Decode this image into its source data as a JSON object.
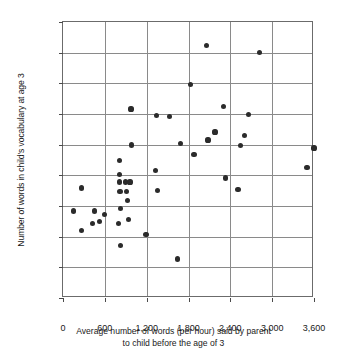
{
  "chart_data": {
    "type": "scatter",
    "title": "",
    "xlabel": "Average number of words (per hour) said by parent to child before the age of 3",
    "xlabel_line1": "Average number of words (per hour) said by parent",
    "xlabel_line2": "to child before the age of 3",
    "ylabel": "Number of words in child's vocabulary at age 3",
    "xlim": [
      0,
      3600
    ],
    "ylim": [
      0,
      1800
    ],
    "xticks": [
      0,
      600,
      1200,
      1800,
      2400,
      3000,
      3600
    ],
    "xtick_labels": [
      "0",
      "600",
      "1,200",
      "1,800",
      "2,400",
      "3,000",
      "3,600"
    ],
    "yticks": [
      0,
      200,
      400,
      600,
      800,
      1000,
      1200,
      1400,
      1600,
      1800
    ],
    "ytick_labels": [
      "0",
      "200",
      "400",
      "600",
      "800",
      "1,000",
      "1,200",
      "1,400",
      "1,600",
      "1,800"
    ],
    "grid": true,
    "legend": "none",
    "marker_color": "#2b2b2b",
    "axis_color": "#6b6b6b",
    "grid_color": "#8a8a8a",
    "points": [
      {
        "x": 150,
        "y": 568
      },
      {
        "x": 270,
        "y": 718
      },
      {
        "x": 265,
        "y": 440
      },
      {
        "x": 420,
        "y": 484
      },
      {
        "x": 455,
        "y": 568
      },
      {
        "x": 520,
        "y": 498
      },
      {
        "x": 600,
        "y": 546
      },
      {
        "x": 800,
        "y": 488
      },
      {
        "x": 805,
        "y": 898
      },
      {
        "x": 810,
        "y": 808
      },
      {
        "x": 815,
        "y": 756
      },
      {
        "x": 818,
        "y": 696
      },
      {
        "x": 820,
        "y": 586
      },
      {
        "x": 830,
        "y": 340
      },
      {
        "x": 900,
        "y": 756
      },
      {
        "x": 905,
        "y": 696
      },
      {
        "x": 930,
        "y": 636
      },
      {
        "x": 940,
        "y": 512
      },
      {
        "x": 960,
        "y": 756
      },
      {
        "x": 975,
        "y": 1232
      },
      {
        "x": 985,
        "y": 998
      },
      {
        "x": 1190,
        "y": 412
      },
      {
        "x": 1330,
        "y": 832
      },
      {
        "x": 1345,
        "y": 1192
      },
      {
        "x": 1360,
        "y": 702
      },
      {
        "x": 1530,
        "y": 1186
      },
      {
        "x": 1640,
        "y": 254
      },
      {
        "x": 1680,
        "y": 1010
      },
      {
        "x": 1830,
        "y": 1392
      },
      {
        "x": 1880,
        "y": 938
      },
      {
        "x": 2060,
        "y": 1648
      },
      {
        "x": 2080,
        "y": 1030
      },
      {
        "x": 2180,
        "y": 1082
      },
      {
        "x": 2300,
        "y": 1250
      },
      {
        "x": 2330,
        "y": 782
      },
      {
        "x": 2510,
        "y": 706
      },
      {
        "x": 2540,
        "y": 996
      },
      {
        "x": 2600,
        "y": 1058
      },
      {
        "x": 2660,
        "y": 1196
      },
      {
        "x": 2820,
        "y": 1600
      },
      {
        "x": 3500,
        "y": 852
      },
      {
        "x": 3600,
        "y": 978
      }
    ]
  }
}
